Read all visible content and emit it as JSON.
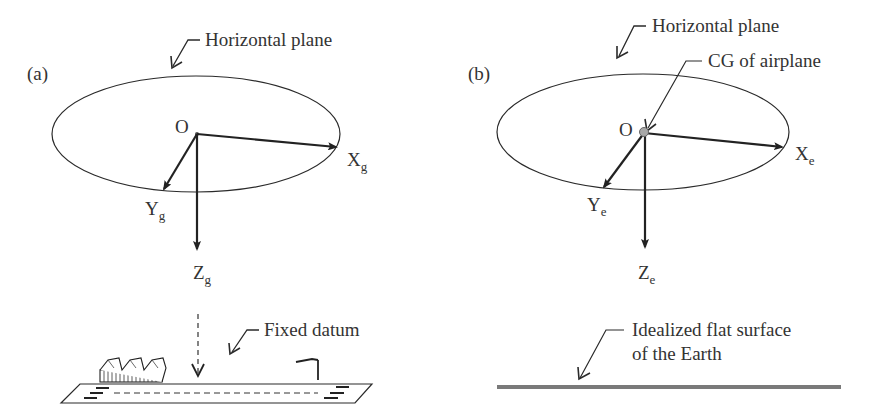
{
  "panels": [
    {
      "id": "a",
      "tag": "(a)",
      "plane_label": "Horizontal plane",
      "origin_label": "O",
      "axes": {
        "x": {
          "main": "X",
          "sub": "g"
        },
        "y": {
          "main": "Y",
          "sub": "g"
        },
        "z": {
          "main": "Z",
          "sub": "g"
        }
      },
      "datum_label": "Fixed datum"
    },
    {
      "id": "b",
      "tag": "(b)",
      "plane_label": "Horizontal plane",
      "cg_label": "CG of airplane",
      "origin_label": "O",
      "axes": {
        "x": {
          "main": "X",
          "sub": "e"
        },
        "y": {
          "main": "Y",
          "sub": "e"
        },
        "z": {
          "main": "Z",
          "sub": "e"
        }
      },
      "surface_label_line1": "Idealized flat surface",
      "surface_label_line2": "of the Earth"
    }
  ],
  "colors": {
    "stroke": "#2a2a2a",
    "text": "#333333",
    "cg_dot": "#a8a8a8",
    "surface": "#7a7a7a"
  }
}
